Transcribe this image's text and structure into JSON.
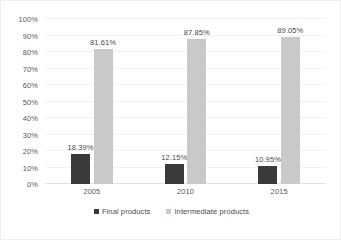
{
  "chart_data": {
    "type": "bar",
    "title": "",
    "subtitle": "",
    "xlabel": "",
    "ylabel": "",
    "categories": [
      "2005",
      "2010",
      "2015"
    ],
    "series": [
      {
        "name": "Final products",
        "color": "#3a3a3a",
        "values": [
          18.39,
          12.15,
          10.95
        ],
        "labels": [
          "18.39%",
          "12.15%",
          "10.95%"
        ]
      },
      {
        "name": "Intermediate products",
        "color": "#c9c9c9",
        "values": [
          81.61,
          87.85,
          89.05
        ],
        "labels": [
          "81.61%",
          "87.85%",
          "89.05%"
        ]
      }
    ],
    "ylim": [
      0,
      100
    ],
    "ytick_step": 10,
    "ytick_labels": [
      "0%",
      "10%",
      "20%",
      "30%",
      "40%",
      "50%",
      "60%",
      "70%",
      "80%",
      "90%",
      "100%"
    ],
    "ytick_values": [
      0,
      10,
      20,
      30,
      40,
      50,
      60,
      70,
      80,
      90,
      100
    ],
    "grid": {
      "horizontal": true,
      "vertical": false,
      "color": "#f2f2f2"
    },
    "legend": {
      "position": "bottom",
      "entries": [
        {
          "label": "Final products",
          "color": "#3a3a3a"
        },
        {
          "label": "Intermediate products",
          "color": "#c9c9c9"
        }
      ]
    },
    "data_labels_shown": true,
    "plot_background": "#ffffff",
    "border_color": "#f0f0f0"
  }
}
